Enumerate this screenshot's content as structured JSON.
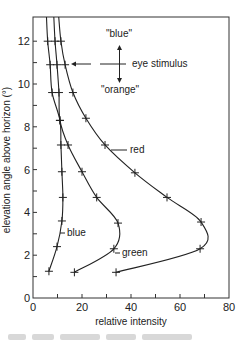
{
  "chart_data": {
    "type": "line",
    "title": "",
    "xlabel": "relative intensity",
    "ylabel": "elevation angle above horizon (°)",
    "xlim": [
      0,
      80
    ],
    "ylim": [
      0,
      13.2
    ],
    "x_ticks": [
      0,
      20,
      40,
      60,
      80
    ],
    "x_minor_ticks": [
      10,
      30,
      50,
      70
    ],
    "y_ticks": [
      0,
      2,
      4,
      6,
      8,
      10,
      12
    ],
    "y_minor_ticks": [
      1,
      3,
      5,
      7,
      9,
      11
    ],
    "grid": false,
    "legend": "inline labels on curves",
    "series": [
      {
        "name": "blue",
        "points": [
          [
            6.5,
            1.25
          ],
          [
            9.8,
            2.4
          ],
          [
            11.8,
            3.6
          ],
          [
            12.2,
            4.7
          ],
          [
            11.8,
            5.9
          ],
          [
            11.4,
            7.15
          ],
          [
            11.0,
            8.3
          ],
          [
            7.8,
            9.6
          ],
          [
            7.0,
            10.9
          ],
          [
            6.0,
            12.0
          ],
          [
            5.5,
            13.2
          ]
        ]
      },
      {
        "name": "green",
        "points": [
          [
            16.9,
            1.2
          ],
          [
            33.0,
            2.3
          ],
          [
            34.7,
            3.5
          ],
          [
            26.0,
            4.7
          ],
          [
            20.0,
            5.9
          ],
          [
            14.3,
            7.15
          ],
          [
            11.0,
            8.3
          ],
          [
            10.6,
            9.6
          ],
          [
            9.8,
            10.9
          ],
          [
            9.0,
            12.0
          ],
          [
            8.5,
            13.2
          ]
        ]
      },
      {
        "name": "red",
        "points": [
          [
            33.9,
            1.2
          ],
          [
            68.2,
            2.3
          ],
          [
            68.6,
            3.55
          ],
          [
            54.7,
            4.7
          ],
          [
            41.6,
            5.85
          ],
          [
            29.4,
            7.15
          ],
          [
            21.6,
            8.4
          ],
          [
            16.3,
            9.6
          ],
          [
            13.1,
            10.9
          ],
          [
            11.4,
            12.0
          ],
          [
            10.5,
            13.2
          ]
        ]
      }
    ],
    "annotations": [
      {
        "text": "\"blue\"",
        "position": "top, above arrow"
      },
      {
        "text": "eye stimulus",
        "position": "right of arrow cross, at ~10.9°"
      },
      {
        "text": "\"orange\"",
        "position": "below arrow"
      },
      {
        "text": "red",
        "position": "label pointing to red curve at ~7.2°"
      },
      {
        "text": "green",
        "position": "label pointing to green curve at ~3°"
      },
      {
        "text": "blue",
        "position": "label pointing to blue curve at ~3°"
      }
    ]
  },
  "labels": {
    "xlabel": "relative intensity",
    "ylabel": "elevation angle above horizon (°)",
    "x_ticks": [
      "0",
      "20",
      "40",
      "60",
      "80"
    ],
    "y_ticks": [
      "0",
      "2",
      "4",
      "6",
      "8",
      "10",
      "12"
    ],
    "ann_blue_q": "\"blue\"",
    "ann_orange_q": "\"orange\"",
    "ann_eye": "eye stimulus",
    "curve_red": "red",
    "curve_green": "green",
    "curve_blue": "blue"
  }
}
